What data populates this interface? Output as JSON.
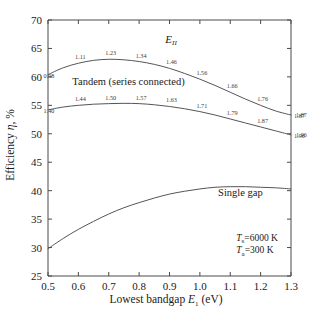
{
  "chart_data": {
    "type": "line",
    "title": "",
    "xlabel": "Lowest bandgap E₁  (eV)",
    "ylabel": "Efficiency η, %",
    "xlim": [
      0.5,
      1.3
    ],
    "ylim": [
      25,
      70
    ],
    "xticks": [
      "0.5",
      "0.6",
      "0.7",
      "0.8",
      "0.9",
      "1.0",
      "1.1",
      "1.2",
      "1.3"
    ],
    "xtick_values": [
      0.5,
      0.6,
      0.7,
      0.8,
      0.9,
      1.0,
      1.1,
      1.2,
      1.3
    ],
    "yticks": [
      "25",
      "30",
      "35",
      "40",
      "45",
      "50",
      "55",
      "60",
      "65",
      "70"
    ],
    "ytick_values": [
      25,
      30,
      35,
      40,
      45,
      50,
      55,
      60,
      65,
      70
    ],
    "grid": false,
    "legend_position": "inline-curve-labels",
    "series": [
      {
        "name": "Tandem (series connected) upper",
        "label_on_plot": "Tandem (series connected)",
        "x": [
          0.5,
          0.55,
          0.6,
          0.65,
          0.7,
          0.75,
          0.8,
          0.85,
          0.9,
          0.95,
          1.0,
          1.05,
          1.1,
          1.15,
          1.2,
          1.25,
          1.3
        ],
        "values": [
          60.4,
          61.6,
          62.4,
          62.9,
          63.1,
          63.0,
          62.7,
          62.2,
          61.5,
          60.6,
          59.6,
          58.5,
          57.3,
          56.1,
          55.0,
          54.0,
          53.3
        ],
        "point_labels": [
          {
            "x": 0.5,
            "y": 60.4,
            "text": "0.98"
          },
          {
            "x": 0.6,
            "y": 62.4,
            "text": "1.11"
          },
          {
            "x": 0.7,
            "y": 63.1,
            "text": "1.23"
          },
          {
            "x": 0.8,
            "y": 62.7,
            "text": "1.34"
          },
          {
            "x": 0.9,
            "y": 61.5,
            "text": "1.46"
          },
          {
            "x": 1.0,
            "y": 59.6,
            "text": "1.56"
          },
          {
            "x": 1.1,
            "y": 57.3,
            "text": "1.66"
          },
          {
            "x": 1.2,
            "y": 55.0,
            "text": "1.76"
          },
          {
            "x": 1.3,
            "y": 53.3,
            "text": "1.87"
          }
        ]
      },
      {
        "name": "Tandem (series connected) lower",
        "x": [
          0.5,
          0.55,
          0.6,
          0.65,
          0.7,
          0.75,
          0.8,
          0.85,
          0.9,
          0.95,
          1.0,
          1.05,
          1.1,
          1.15,
          1.2,
          1.25,
          1.3
        ],
        "values": [
          54.2,
          54.7,
          55.0,
          55.2,
          55.3,
          55.35,
          55.3,
          55.1,
          54.8,
          54.4,
          53.9,
          53.3,
          52.6,
          51.9,
          51.2,
          50.5,
          49.8
        ],
        "point_labels": [
          {
            "x": 0.5,
            "y": 54.2,
            "text": "1.40"
          },
          {
            "x": 0.6,
            "y": 55.0,
            "text": "1.44"
          },
          {
            "x": 0.7,
            "y": 55.3,
            "text": "1.50"
          },
          {
            "x": 0.8,
            "y": 55.3,
            "text": "1.57"
          },
          {
            "x": 0.9,
            "y": 54.8,
            "text": "1.63"
          },
          {
            "x": 1.0,
            "y": 53.9,
            "text": "1.71"
          },
          {
            "x": 1.1,
            "y": 52.6,
            "text": "1.79"
          },
          {
            "x": 1.2,
            "y": 51.2,
            "text": "1.87"
          },
          {
            "x": 1.3,
            "y": 49.8,
            "text": "1.96"
          }
        ]
      },
      {
        "name": "Single gap",
        "label_on_plot": "Single gap",
        "x": [
          0.5,
          0.55,
          0.6,
          0.65,
          0.7,
          0.75,
          0.8,
          0.85,
          0.9,
          0.95,
          1.0,
          1.05,
          1.1,
          1.15,
          1.2,
          1.25,
          1.3
        ],
        "values": [
          29.8,
          31.6,
          33.2,
          34.6,
          35.9,
          37.0,
          37.9,
          38.7,
          39.4,
          39.9,
          40.3,
          40.6,
          40.7,
          40.7,
          40.6,
          40.5,
          40.3
        ],
        "point_labels": []
      }
    ],
    "annotations": [
      {
        "name": "e-two-label",
        "text": "E",
        "subscript": "II",
        "x": 0.905,
        "y": 66.0
      },
      {
        "name": "tandem-curve-label",
        "text": "Tandem (series connected)",
        "x": 0.58,
        "y": 58.6
      },
      {
        "name": "single-gap-curve-label",
        "text": "Single gap",
        "x": 1.06,
        "y": 39.0
      },
      {
        "name": "sun-temperature",
        "text": "=6000 K",
        "symbol": "T",
        "subscript": "s",
        "x": 1.12,
        "y": 31.2
      },
      {
        "name": "ambient-temperature",
        "text": "=300 K",
        "symbol": "T",
        "subscript": "a",
        "x": 1.12,
        "y": 29.0
      }
    ],
    "right_edge_labels": [
      {
        "text": "1.87",
        "y": 53.3
      },
      {
        "text": "1.96",
        "y": 49.8
      }
    ],
    "colors": {
      "axis": "#4a4a4a",
      "curve": "#555555",
      "text": "#1a1a1a",
      "background": "#ffffff"
    }
  }
}
